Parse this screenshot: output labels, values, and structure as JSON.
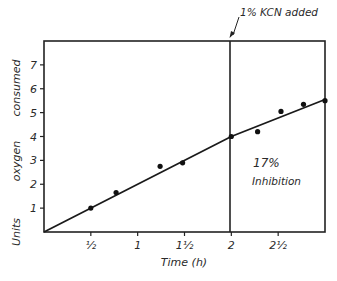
{
  "chart_data": {
    "type": "line",
    "title": "",
    "xlabel": "Time (h)",
    "ylabel": "Units  oxygen  consumed",
    "xlim": [
      0,
      3
    ],
    "ylim": [
      0,
      8
    ],
    "grid": false,
    "legend": null,
    "x_ticks": [
      {
        "value": 0.5,
        "label": "½"
      },
      {
        "value": 1.0,
        "label": "1"
      },
      {
        "value": 1.5,
        "label": "1½"
      },
      {
        "value": 2.0,
        "label": "2"
      },
      {
        "value": 2.5,
        "label": "2½"
      }
    ],
    "y_ticks": [
      {
        "value": 1,
        "label": "1"
      },
      {
        "value": 2,
        "label": "2"
      },
      {
        "value": 3,
        "label": "3"
      },
      {
        "value": 4,
        "label": "4"
      },
      {
        "value": 5,
        "label": "5"
      },
      {
        "value": 6,
        "label": "6"
      },
      {
        "value": 7,
        "label": "7"
      }
    ],
    "series": [
      {
        "name": "Observed",
        "kind": "scatter",
        "points": [
          {
            "x": 0.5,
            "y": 1.0
          },
          {
            "x": 0.77,
            "y": 1.65
          },
          {
            "x": 1.24,
            "y": 2.75
          },
          {
            "x": 1.48,
            "y": 2.9
          },
          {
            "x": 2.0,
            "y": 4.0
          },
          {
            "x": 2.28,
            "y": 4.2
          },
          {
            "x": 2.53,
            "y": 5.05
          },
          {
            "x": 2.77,
            "y": 5.35
          },
          {
            "x": 3.0,
            "y": 5.5
          }
        ]
      },
      {
        "name": "Fitted line",
        "kind": "line",
        "points": [
          {
            "x": 0.0,
            "y": 0.0
          },
          {
            "x": 2.0,
            "y": 4.0
          },
          {
            "x": 3.0,
            "y": 5.55
          }
        ]
      }
    ],
    "annotations": [
      {
        "text": "1% KCN added",
        "x": 2.0,
        "type": "vertical-line-arrow"
      },
      {
        "text": "17%",
        "x": 2.2,
        "y": 3.6
      },
      {
        "text": "Inhibition",
        "x": 2.2,
        "y": 2.8
      }
    ]
  },
  "labels": {
    "ylabel_words": [
      "Units",
      "oxygen",
      "consumed"
    ],
    "xlabel": "Time (h)",
    "kcn": "1% KCN added",
    "pct": "17%",
    "inhibition": "Inhibition"
  }
}
